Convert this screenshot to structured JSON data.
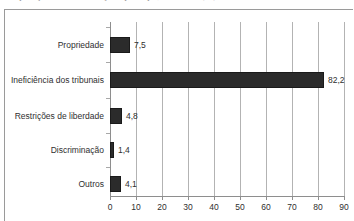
{
  "caption_remnant": "Composição das reclamações por tipo, em 2003 (%)",
  "chart_data": {
    "type": "bar",
    "orientation": "horizontal",
    "title": "",
    "xlabel": "",
    "ylabel": "",
    "categories": [
      "Propriedade",
      "Ineficiência dos tribunais",
      "Restrições de liberdade",
      "Discriminação",
      "Outros"
    ],
    "values": [
      7.5,
      82.2,
      4.8,
      1.4,
      4.1
    ],
    "value_labels": [
      "7,5",
      "82,2",
      "4,8",
      "1,4",
      "4,1"
    ],
    "xlim": [
      0,
      90
    ],
    "xticks": [
      0,
      10,
      20,
      30,
      40,
      50,
      60,
      70,
      80,
      90
    ],
    "xtick_labels": [
      "0",
      "10",
      "20",
      "30",
      "40",
      "50",
      "60",
      "70",
      "80",
      "90"
    ],
    "grid": true,
    "grid_axis": "x",
    "legend": null,
    "bar_color": "#2b2b2b",
    "grid_color": "#b3b3b3",
    "axis_color": "#8e8e8e",
    "background_color": "#ffffff",
    "frame_color": "#9a9a9a"
  }
}
